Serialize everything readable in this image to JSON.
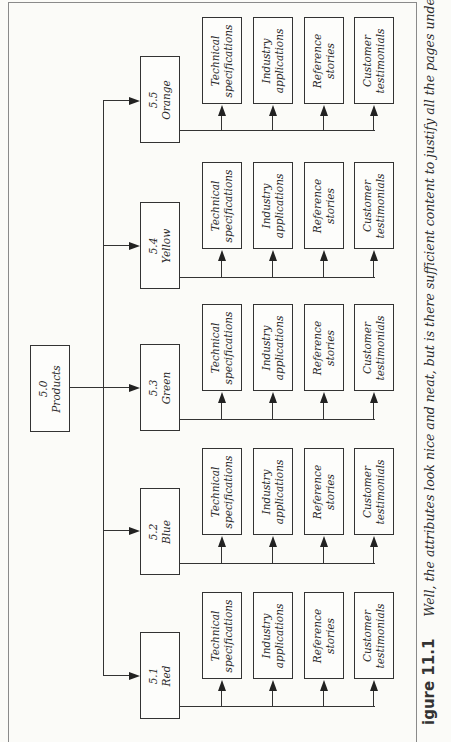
{
  "root": {
    "number": "5.0",
    "label": "Products"
  },
  "products": [
    {
      "number": "5.5",
      "label": "Orange",
      "box_top": 56,
      "arrow_y": 100,
      "children_top": 17,
      "connector_y": 130
    },
    {
      "number": "5.4",
      "label": "Yellow",
      "box_top": 202,
      "arrow_y": 245,
      "children_top": 162,
      "connector_y": 277
    },
    {
      "number": "5.3",
      "label": "Green",
      "box_top": 344,
      "arrow_y": 387,
      "children_top": 304,
      "connector_y": 419
    },
    {
      "number": "5.2",
      "label": "Blue",
      "box_top": 488,
      "arrow_y": 530,
      "children_top": 448,
      "connector_y": 563
    },
    {
      "number": "5.1",
      "label": "Red",
      "box_top": 632,
      "arrow_y": 675,
      "children_top": 592,
      "connector_y": 706
    }
  ],
  "child_pages": [
    {
      "line1": "Technical",
      "line2": "specifications"
    },
    {
      "line1": "Industry",
      "line2": "applications"
    },
    {
      "line1": "Reference",
      "line2": "stories"
    },
    {
      "line1": "Customer",
      "line2": "testimonials"
    }
  ],
  "caption": {
    "figure_label": "igure 11.1",
    "text": "Well, the attributes look nice and neat, but is there sufficient content to justify all the pages under all the products? For"
  },
  "colors": {
    "line": "#333333",
    "background": "#fbfbf8",
    "frame": "#8a8a8a"
  }
}
